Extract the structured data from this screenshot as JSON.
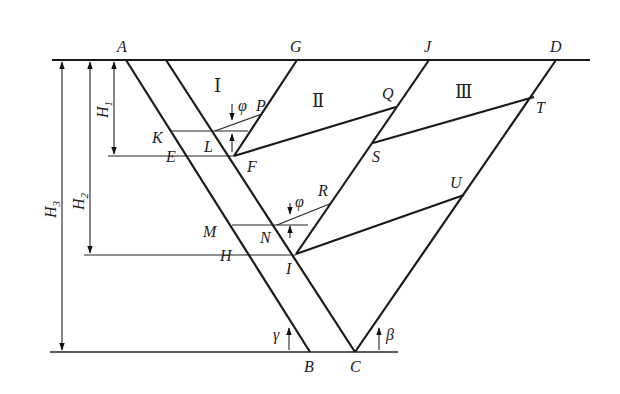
{
  "diagram": {
    "points": {
      "A": "A",
      "G": "G",
      "J": "J",
      "D": "D",
      "K": "K",
      "L": "L",
      "E": "E",
      "F": "F",
      "P": "P",
      "Q": "Q",
      "S": "S",
      "T": "T",
      "M": "M",
      "N": "N",
      "H": "H",
      "I": "I",
      "R": "R",
      "U": "U",
      "B": "B",
      "C": "C"
    },
    "regions": {
      "r1": "Ⅰ",
      "r2": "Ⅱ",
      "r3": "Ⅲ"
    },
    "dimensions": {
      "h1": "H",
      "h1_sub": "1",
      "h2": "H",
      "h2_sub": "2",
      "h3": "H",
      "h3_sub": "3"
    },
    "angles": {
      "phi1": "φ",
      "phi2": "φ",
      "gamma": "γ",
      "beta": "β"
    }
  }
}
